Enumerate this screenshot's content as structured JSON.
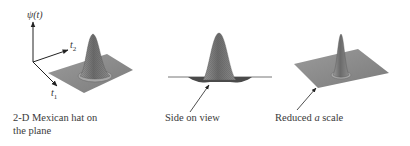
{
  "figure": {
    "panels": [
      {
        "id": "mexican-hat-plane",
        "caption_lines": [
          "2-D Mexican hat on",
          "the plane"
        ],
        "axes": {
          "vertical": "ψ(t)",
          "t2": "t",
          "t2_sub": "2",
          "t1": "t",
          "t1_sub": "1"
        }
      },
      {
        "id": "side-view",
        "caption_lines": [
          "Side on view"
        ]
      },
      {
        "id": "reduced-scale",
        "caption_before": "Reduced ",
        "caption_italic": "a",
        "caption_after": " scale"
      }
    ],
    "colors": {
      "plane": "#8a8a8a",
      "hat": "#6e6e6e",
      "line": "#333333"
    }
  }
}
